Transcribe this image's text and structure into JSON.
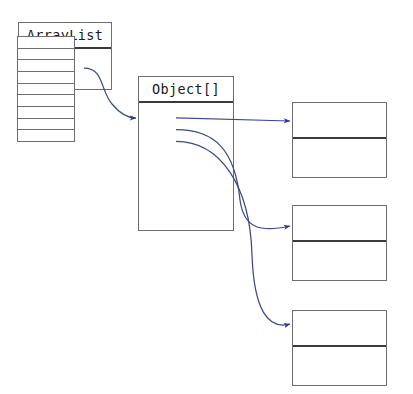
{
  "diagram": {
    "kind": "object-reference-diagram",
    "background_color": "#ffffff",
    "box_border_color": "#6e6e6e",
    "divider_color": "#3a3a3a",
    "connector_color": "#3b4a8c",
    "arrowhead_color": "#2b3a8c",
    "cell_line_color": "#6e6e6e"
  },
  "arraylist": {
    "title": "ArrayList",
    "field_label": "",
    "body_label": ""
  },
  "object_array": {
    "title": "Object[]",
    "cell_count": 9,
    "cells": [
      {
        "index": 0,
        "value": "",
        "has_reference": true
      },
      {
        "index": 1,
        "value": "",
        "has_reference": true
      },
      {
        "index": 2,
        "value": "",
        "has_reference": true
      },
      {
        "index": 3,
        "value": "",
        "has_reference": false
      },
      {
        "index": 4,
        "value": "",
        "has_reference": false
      },
      {
        "index": 5,
        "value": "",
        "has_reference": false
      },
      {
        "index": 6,
        "value": "",
        "has_reference": false
      },
      {
        "index": 7,
        "value": "",
        "has_reference": false
      },
      {
        "index": 8,
        "value": "",
        "has_reference": false
      }
    ]
  },
  "elements": [
    {
      "index": 0,
      "title": "",
      "body": ""
    },
    {
      "index": 1,
      "title": "",
      "body": ""
    },
    {
      "index": 2,
      "title": "",
      "body": ""
    }
  ],
  "connectors": [
    {
      "id": "arraylist-to-array",
      "from": "arraylist.field",
      "to": "object_array.box"
    },
    {
      "id": "cell-0-to-element-0",
      "from": "object_array.cells.0",
      "to": "elements.0"
    },
    {
      "id": "cell-1-to-element-1",
      "from": "object_array.cells.1",
      "to": "elements.1"
    },
    {
      "id": "cell-2-to-element-2",
      "from": "object_array.cells.2",
      "to": "elements.2"
    }
  ]
}
